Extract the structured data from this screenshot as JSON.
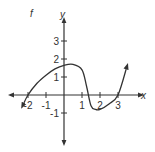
{
  "chart_data": {
    "type": "line",
    "title": "f",
    "xlabel": "x",
    "ylabel": "y",
    "xlim": [
      -2.5,
      3.8
    ],
    "ylim": [
      -1.8,
      3.7
    ],
    "grid": false,
    "x_ticks": [
      -2,
      -1,
      1,
      2,
      3
    ],
    "y_ticks": [
      3,
      2,
      1,
      -1
    ],
    "x_tick_labels": [
      "-2",
      "-1",
      "1",
      "2",
      "3"
    ],
    "y_tick_labels": [
      "3",
      "2",
      "1",
      "-1"
    ],
    "series": [
      {
        "name": "f",
        "x": [
          -2.3,
          -2.0,
          -1.5,
          -1.0,
          -0.5,
          0.0,
          0.5,
          1.0,
          1.25,
          1.5,
          1.75,
          2.0,
          2.5,
          3.0,
          3.5
        ],
        "y": [
          -0.6,
          0.0,
          0.65,
          1.1,
          1.45,
          1.65,
          1.7,
          1.4,
          0.5,
          -0.6,
          -0.8,
          -0.8,
          -0.5,
          0.0,
          1.6
        ],
        "arrows": "both ends"
      }
    ],
    "features": {
      "x_intercepts": [
        -2,
        1.3,
        3
      ],
      "y_intercept": 1.6,
      "local_max": [
        0.5,
        1.7
      ],
      "local_min": [
        2,
        -0.8
      ]
    },
    "color": "#333333"
  }
}
